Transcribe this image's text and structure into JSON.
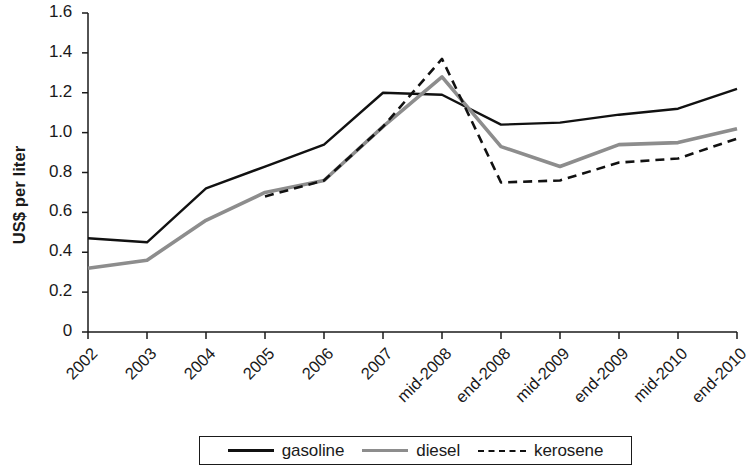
{
  "chart_data": {
    "type": "line",
    "title": "",
    "xlabel": "",
    "ylabel": "US$ per liter",
    "ylim": [
      0,
      1.6
    ],
    "ytick_values": [
      0,
      0.2,
      0.4,
      0.6,
      0.8,
      1.0,
      1.2,
      1.4,
      1.6
    ],
    "ytick_labels": [
      "0",
      "0.2",
      "0.4",
      "0.6",
      "0.8",
      "1.0",
      "1.2",
      "1.4",
      "1.6"
    ],
    "grid": false,
    "legend_position": "bottom",
    "categories": [
      "2002",
      "2003",
      "2004",
      "2005",
      "2006",
      "2007",
      "mid-2008",
      "end-2008",
      "mid-2009",
      "end-2009",
      "mid-2010",
      "end-2010"
    ],
    "series": [
      {
        "name": "gasoline",
        "color": "#111111",
        "style": "solid",
        "values": [
          0.47,
          0.45,
          0.72,
          0.83,
          0.94,
          1.2,
          1.19,
          1.04,
          1.05,
          1.09,
          1.12,
          1.22
        ]
      },
      {
        "name": "diesel",
        "color": "#8d8d8d",
        "style": "solid",
        "values": [
          0.32,
          0.36,
          0.56,
          0.7,
          0.76,
          1.03,
          1.28,
          0.93,
          0.83,
          0.94,
          0.95,
          1.02
        ]
      },
      {
        "name": "kerosene",
        "color": "#111111",
        "style": "dashed",
        "values": [
          null,
          null,
          null,
          0.68,
          0.76,
          1.03,
          1.37,
          0.75,
          0.76,
          0.85,
          0.87,
          0.97
        ]
      }
    ]
  },
  "axes": {
    "y_axis_label": "US$ per liter"
  },
  "legend": {
    "items": [
      {
        "label": "gasoline"
      },
      {
        "label": "diesel"
      },
      {
        "label": "kerosene"
      }
    ]
  }
}
